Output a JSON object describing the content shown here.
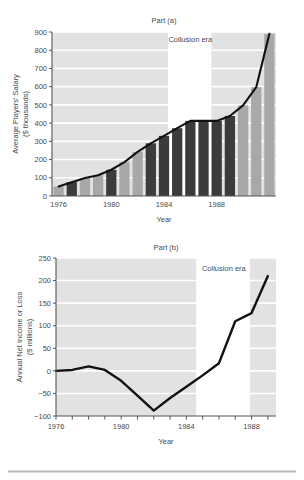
{
  "figure": {
    "background_color": "#ffffff",
    "plot_background_color": "#e2e2e2",
    "gridline_color": "#ffffff",
    "axis_color": "#555555",
    "line_color": "#111111",
    "bar_light_color": "#a8a8a8",
    "bar_dark_color": "#3b3b3b",
    "era_band_color": "#ffffff",
    "footer_rule_color": "#b9b9b9"
  },
  "chart_data": [
    {
      "id": "part-a",
      "type": "bar",
      "title": "Part (a)",
      "xlabel": "Year",
      "ylabel": "Average Players' Salary\n($ thousands)",
      "ylabel_line1": "Average Players' Salary",
      "ylabel_line2": "($ thousands)",
      "xlim": [
        1975.5,
        1992.5
      ],
      "ylim": [
        0,
        900
      ],
      "yticks": [
        0,
        100,
        200,
        300,
        400,
        500,
        600,
        700,
        800,
        900
      ],
      "ytick_labels": [
        "0",
        "100",
        "200",
        "300",
        "400",
        "500",
        "600",
        "700",
        "800",
        "900"
      ],
      "xticks": [
        1976,
        1980,
        1984,
        1988
      ],
      "xtick_labels": [
        "1976",
        "1980",
        "1984",
        "1988"
      ],
      "grid": true,
      "annotations": [
        {
          "text": "Collusion era",
          "x_start": 1984.3,
          "x_end": 1987.6,
          "label_x": 1986.0,
          "label_y": 845
        }
      ],
      "categories": [
        1976,
        1977,
        1978,
        1979,
        1980,
        1981,
        1982,
        1983,
        1984,
        1985,
        1986,
        1987,
        1988,
        1989,
        1990,
        1991,
        1992
      ],
      "values": [
        52,
        76,
        99,
        114,
        144,
        186,
        242,
        289,
        330,
        372,
        412,
        412,
        412,
        439,
        497,
        597,
        890
      ],
      "bar_shades": [
        "light",
        "dark",
        "light",
        "light",
        "dark",
        "light",
        "light",
        "dark",
        "dark",
        "dark",
        "dark",
        "dark",
        "dark",
        "dark",
        "light",
        "light",
        "light"
      ],
      "overlay_series": {
        "name": "Average Players' Salary",
        "x": [
          1976,
          1977,
          1978,
          1979,
          1980,
          1981,
          1982,
          1983,
          1984,
          1985,
          1986,
          1987,
          1988,
          1989,
          1990,
          1991,
          1992
        ],
        "values": [
          52,
          76,
          99,
          114,
          144,
          186,
          242,
          289,
          330,
          372,
          412,
          412,
          412,
          439,
          497,
          597,
          890
        ]
      }
    },
    {
      "id": "part-b",
      "type": "line",
      "title": "Part (b)",
      "xlabel": "Year",
      "ylabel": "Annual Net Income or Loss\n($ millions)",
      "ylabel_line1": "Annual Net Income or Loss",
      "ylabel_line2": "($ millions)",
      "xlim": [
        1976,
        1989.5
      ],
      "ylim": [
        -100,
        250
      ],
      "yticks": [
        -100,
        -50,
        0,
        50,
        100,
        150,
        200,
        250
      ],
      "ytick_labels": [
        "−100",
        "−50",
        "0",
        "50",
        "100",
        "150",
        "200",
        "250"
      ],
      "xticks": [
        1976,
        1977,
        1978,
        1979,
        1980,
        1981,
        1982,
        1983,
        1984,
        1985,
        1986,
        1987,
        1988,
        1989
      ],
      "xtick_major": [
        1976,
        1980,
        1984,
        1988
      ],
      "xtick_labels": [
        "1976",
        "1980",
        "1984",
        "1988"
      ],
      "grid": true,
      "annotations": [
        {
          "text": "Collusion era",
          "x_start": 1984.6,
          "x_end": 1987.9,
          "label_x": 1986.3,
          "label_y": 222
        }
      ],
      "x": [
        1976,
        1977,
        1978,
        1979,
        1980,
        1981,
        1982,
        1983,
        1984,
        1985,
        1986,
        1987,
        1988,
        1989
      ],
      "values": [
        0,
        2,
        10,
        2,
        -22,
        -55,
        -88,
        -60,
        -35,
        -10,
        17,
        110,
        128,
        210
      ]
    }
  ]
}
